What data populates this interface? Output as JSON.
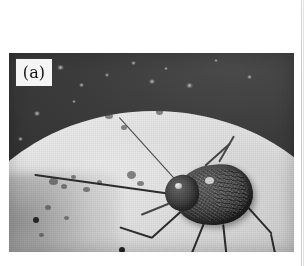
{
  "figure": {
    "panel_label": "(a)",
    "caption": "",
    "photo": {
      "alt_description": "Grayscale close-up photograph of a long-horned beetle resting on a pale rounded surface against a dark background",
      "geometry": {
        "x": 9,
        "y": 53,
        "width": 285,
        "height": 199
      },
      "colors": {
        "backdrop_dark": "#3c3c3c",
        "host_light": "#dedcd9",
        "host_mid": "#b9b7b3",
        "insect_dark": "#403d3b",
        "label_box_fill": "#f4f3f1",
        "label_box_border": "#3b3937",
        "page_background": "#ffffff",
        "page_edge_rule": "#c6c6c6"
      }
    },
    "specks": [
      {
        "x": 48,
        "y": 12,
        "w": 7,
        "h": 5
      },
      {
        "x": 70,
        "y": 30,
        "w": 5,
        "h": 4
      },
      {
        "x": 96,
        "y": 20,
        "w": 4,
        "h": 4
      },
      {
        "x": 122,
        "y": 8,
        "w": 5,
        "h": 4
      },
      {
        "x": 140,
        "y": 26,
        "w": 6,
        "h": 5
      },
      {
        "x": 155,
        "y": 14,
        "w": 4,
        "h": 3
      },
      {
        "x": 177,
        "y": 30,
        "w": 7,
        "h": 5
      },
      {
        "x": 25,
        "y": 58,
        "w": 6,
        "h": 5
      },
      {
        "x": 9,
        "y": 84,
        "w": 5,
        "h": 4
      },
      {
        "x": 63,
        "y": 47,
        "w": 4,
        "h": 3
      },
      {
        "x": 205,
        "y": 6,
        "w": 4,
        "h": 3
      },
      {
        "x": 238,
        "y": 22,
        "w": 5,
        "h": 4
      }
    ],
    "blemishes": [
      {
        "x": 40,
        "y": 125,
        "w": 9,
        "h": 7
      },
      {
        "x": 52,
        "y": 131,
        "w": 6,
        "h": 5
      },
      {
        "x": 62,
        "y": 122,
        "w": 5,
        "h": 4
      },
      {
        "x": 74,
        "y": 134,
        "w": 7,
        "h": 5
      },
      {
        "x": 88,
        "y": 127,
        "w": 5,
        "h": 5
      },
      {
        "x": 118,
        "y": 118,
        "w": 9,
        "h": 8
      },
      {
        "x": 128,
        "y": 128,
        "w": 7,
        "h": 5
      },
      {
        "x": 36,
        "y": 152,
        "w": 6,
        "h": 5
      },
      {
        "x": 55,
        "y": 163,
        "w": 5,
        "h": 4
      },
      {
        "x": 96,
        "y": 60,
        "w": 8,
        "h": 6
      },
      {
        "x": 112,
        "y": 72,
        "w": 6,
        "h": 5
      },
      {
        "x": 147,
        "y": 56,
        "w": 7,
        "h": 6
      },
      {
        "x": 176,
        "y": 48,
        "w": 6,
        "h": 5
      },
      {
        "x": 212,
        "y": 138,
        "w": 9,
        "h": 6
      },
      {
        "x": 30,
        "y": 180,
        "w": 5,
        "h": 4
      }
    ],
    "limbs": [
      {
        "name": "antenna-left-long",
        "x": 176,
        "y": 142,
        "len": 152,
        "deg": 188,
        "thick": 2.0,
        "soft": false
      },
      {
        "name": "antenna-right-upper",
        "x": 172,
        "y": 132,
        "len": 92,
        "deg": 228,
        "thick": 1.4,
        "soft": true
      },
      {
        "name": "leg-front-left",
        "x": 178,
        "y": 152,
        "len": 48,
        "deg": 138,
        "thick": 2.2,
        "soft": false
      },
      {
        "name": "leg-front-left-tarsus",
        "x": 143,
        "y": 184,
        "len": 34,
        "deg": 198,
        "thick": 1.8,
        "soft": false
      },
      {
        "name": "leg-mid-left",
        "x": 196,
        "y": 166,
        "len": 40,
        "deg": 112,
        "thick": 2.4,
        "soft": false
      },
      {
        "name": "leg-mid-left-tarsus",
        "x": 181,
        "y": 203,
        "len": 28,
        "deg": 12,
        "thick": 1.8,
        "soft": false
      },
      {
        "name": "leg-hind-left",
        "x": 214,
        "y": 170,
        "len": 44,
        "deg": 84,
        "thick": 2.4,
        "soft": false
      },
      {
        "name": "leg-hind-left-tarsus",
        "x": 218,
        "y": 214,
        "len": 22,
        "deg": 96,
        "thick": 1.8,
        "soft": false
      },
      {
        "name": "leg-front-right",
        "x": 236,
        "y": 150,
        "len": 40,
        "deg": 48,
        "thick": 2.4,
        "soft": false
      },
      {
        "name": "leg-front-right-tarsus",
        "x": 262,
        "y": 180,
        "len": 24,
        "deg": 78,
        "thick": 1.8,
        "soft": false
      },
      {
        "name": "leg-mid-right",
        "x": 196,
        "y": 112,
        "len": 34,
        "deg": 318,
        "thick": 2.0,
        "soft": true
      },
      {
        "name": "leg-hind-right",
        "x": 210,
        "y": 108,
        "len": 30,
        "deg": 300,
        "thick": 1.8,
        "soft": true
      },
      {
        "name": "mandible-probe",
        "x": 160,
        "y": 150,
        "len": 30,
        "deg": 158,
        "thick": 1.6,
        "soft": true
      }
    ],
    "limb_tips": [
      {
        "name": "antenna-left-tip",
        "x": 24,
        "y": 164
      },
      {
        "name": "leg-front-left-tip",
        "x": 110,
        "y": 194
      },
      {
        "name": "leg-mid-left-tip",
        "x": 208,
        "y": 206
      },
      {
        "name": "leg-hind-left-tip",
        "x": 217,
        "y": 235
      },
      {
        "name": "leg-front-right-tip",
        "x": 266,
        "y": 203
      }
    ]
  }
}
